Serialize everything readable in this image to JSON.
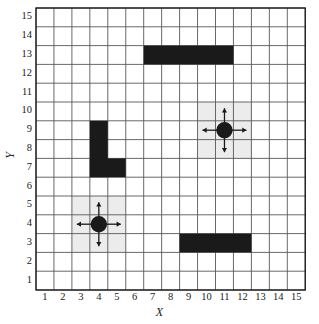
{
  "chart_data": {
    "type": "grid-map",
    "title": "",
    "xlabel": "X",
    "ylabel": "Y",
    "xlim": [
      1,
      15
    ],
    "ylim": [
      1,
      15
    ],
    "grid": true,
    "legend": "none",
    "x_ticks": [
      "1",
      "2",
      "3",
      "4",
      "5",
      "6",
      "7",
      "8",
      "9",
      "10",
      "11",
      "12",
      "13",
      "14",
      "15"
    ],
    "y_ticks": [
      "1",
      "2",
      "3",
      "4",
      "5",
      "6",
      "7",
      "8",
      "9",
      "10",
      "11",
      "12",
      "13",
      "14",
      "15"
    ],
    "colors": {
      "obstacle": "#1a1a1a",
      "highlight": "#ececec",
      "grid_line": "#58585a",
      "axis": "#1a1a1a",
      "background": "#ffffff"
    },
    "obstacles": [
      {
        "name": "top-bar",
        "cells_x": [
          7,
          11
        ],
        "cells_y": [
          13,
          13
        ]
      },
      {
        "name": "l-shape-vertical",
        "cells_x": [
          4,
          4
        ],
        "cells_y": [
          7,
          9
        ]
      },
      {
        "name": "l-shape-horizontal",
        "cells_x": [
          4,
          5
        ],
        "cells_y": [
          7,
          7
        ]
      },
      {
        "name": "bottom-bar",
        "cells_x": [
          9,
          12
        ],
        "cells_y": [
          3,
          3
        ]
      }
    ],
    "agents": [
      {
        "name": "agent-lower",
        "x": 4,
        "y": 4,
        "region_x": [
          3,
          5
        ],
        "region_y": [
          3,
          5
        ],
        "arrows": [
          "up",
          "down",
          "left",
          "right"
        ]
      },
      {
        "name": "agent-upper",
        "x": 11,
        "y": 9,
        "region_x": [
          10,
          12
        ],
        "region_y": [
          8,
          10
        ],
        "arrows": [
          "up",
          "down",
          "left",
          "right"
        ]
      }
    ]
  }
}
